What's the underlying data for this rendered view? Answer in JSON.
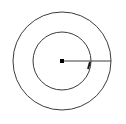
{
  "figure": {
    "canvas": {
      "width": 126,
      "height": 124,
      "background_color": "#ffffff"
    },
    "stroke_color": "#3c3c3c",
    "marker_color": "#000000",
    "center_point": {
      "label": "center-point",
      "x": 62,
      "y": 61,
      "marker": "filled-square",
      "size": 4
    },
    "shapes": [
      {
        "name": "outer-circle",
        "type": "circle",
        "cx": 62,
        "cy": 61,
        "r": 49,
        "stroke_width": 1,
        "fill": "none"
      },
      {
        "name": "inner-circle",
        "type": "circle",
        "cx": 62,
        "cy": 61,
        "r": 29,
        "stroke_width": 1,
        "fill": "none"
      }
    ],
    "segments": [
      {
        "name": "radius-line",
        "type": "line",
        "x1": 62,
        "y1": 61,
        "x2": 111,
        "y2": 61,
        "stroke_width": 1
      },
      {
        "name": "intersection-tick",
        "type": "line",
        "x1": 90,
        "y1": 62,
        "x2": 88,
        "y2": 69,
        "stroke_width": 2
      }
    ],
    "annotations": {
      "top_edge_artifacts": "faint cropped text remnants",
      "visible_labels": []
    }
  }
}
